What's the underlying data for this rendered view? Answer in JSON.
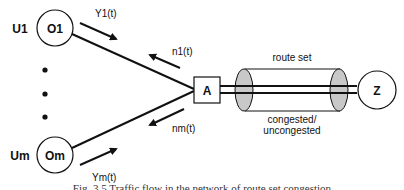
{
  "diagram": {
    "origins": [
      {
        "user_label": "U1",
        "node_label": "O1",
        "flow_label": "Y1(t)",
        "return_label": "n1(t)"
      },
      {
        "user_label": "Um",
        "node_label": "Om",
        "flow_label": "Ym(t)",
        "return_label": "nm(t)"
      }
    ],
    "ellipsis_dots": 3,
    "junction_node": {
      "label": "A"
    },
    "destination_node": {
      "label": "Z"
    },
    "route_set": {
      "label": "route set",
      "state_label_line1": "congested/",
      "state_label_line2": "uncongested"
    },
    "colors": {
      "stroke": "#111111",
      "cylinder_cap": "#c8c8c8",
      "background": "#ffffff"
    }
  },
  "caption": "Fig. 3.5 Traffic flow in the network of route set congestion"
}
